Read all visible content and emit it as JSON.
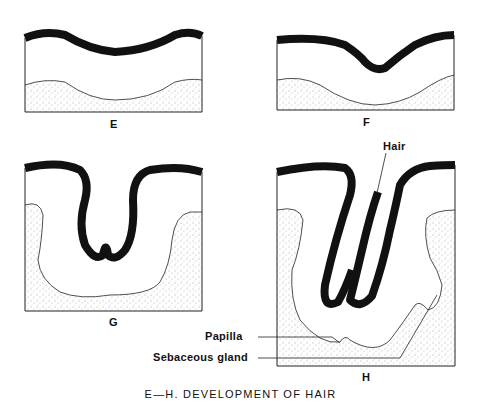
{
  "figure": {
    "caption": "E—H. DEVELOPMENT OF HAIR",
    "panels": [
      {
        "id": "E",
        "label": "E"
      },
      {
        "id": "F",
        "label": "F"
      },
      {
        "id": "G",
        "label": "G"
      },
      {
        "id": "H",
        "label": "H"
      }
    ],
    "annotations": {
      "hair": "Hair",
      "papilla": "Papilla",
      "sebaceous_gland": "Sebaceous gland"
    },
    "colors": {
      "epidermis": "#111111",
      "outline": "#222222",
      "stipple": "#555555",
      "background": "#ffffff"
    }
  }
}
